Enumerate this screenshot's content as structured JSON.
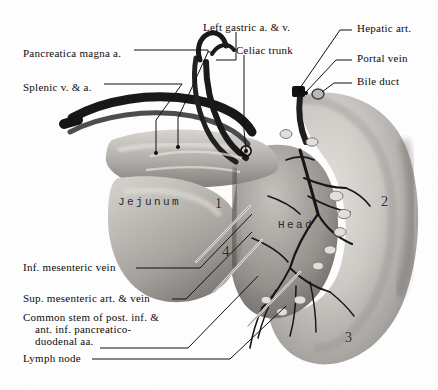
{
  "figure": {
    "background_color": "#ffffff",
    "ink_color": "#0b0b0b"
  },
  "labels": [
    {
      "id": "pancreatica-magna",
      "text": "Pancreatica magna a.",
      "x": 23,
      "y": 48
    },
    {
      "id": "splenic-v-a",
      "text": "Splenic v. & a.",
      "x": 23,
      "y": 82
    },
    {
      "id": "left-gastric",
      "text": "Left gastric a. & v.",
      "x": 203,
      "y": 22
    },
    {
      "id": "celiac-trunk",
      "text": "Celiac trunk",
      "x": 236,
      "y": 45
    },
    {
      "id": "hepatic-art",
      "text": "Hepatic art.",
      "x": 357,
      "y": 27
    },
    {
      "id": "portal-vein",
      "text": "Portal vein",
      "x": 357,
      "y": 57
    },
    {
      "id": "bile-duct",
      "text": "Bile duct",
      "x": 357,
      "y": 80
    },
    {
      "id": "inf-mesenteric-vein",
      "text": "Inf. mesenteric vein",
      "x": 23,
      "y": 264
    },
    {
      "id": "sup-mesenteric",
      "text": "Sup. mesenteric art. & vein",
      "x": 23,
      "y": 295
    },
    {
      "id": "lymph-node",
      "text": "Lymph node",
      "x": 23,
      "y": 355
    }
  ],
  "multiline_labels": [
    {
      "id": "common-stem",
      "line1": "Common stem of post. inf. &",
      "line2": "ant. inf. pancreatico-",
      "line3": "duodenal aa.",
      "x": 23,
      "y": 314
    }
  ],
  "specimen_marks": [
    {
      "id": "region-1",
      "text": "1",
      "x": 215,
      "y": 203,
      "size": 14
    },
    {
      "id": "region-2",
      "text": "2",
      "x": 381,
      "y": 200,
      "size": 14
    },
    {
      "id": "region-3",
      "text": "3",
      "x": 345,
      "y": 337,
      "size": 14
    },
    {
      "id": "region-4",
      "text": "4",
      "x": 222,
      "y": 250,
      "size": 15
    }
  ],
  "typed_overlays": [
    {
      "id": "jejunum-overlay",
      "text": "Jejunum",
      "x": 118,
      "y": 200
    },
    {
      "id": "head-overlay",
      "text": "Head",
      "x": 278,
      "y": 223
    }
  ],
  "colors": {
    "specimen_light": "#d8d5d0",
    "specimen_mid": "#a9a5a0",
    "specimen_dark": "#6e6a66",
    "vessel_dark": "#1b1b1b",
    "leader": "#111111"
  }
}
